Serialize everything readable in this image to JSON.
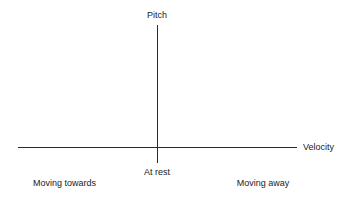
{
  "chart_data": {
    "type": "line",
    "title": "",
    "xlabel": "Velocity",
    "ylabel": "Pitch",
    "grid": false,
    "legend": "none",
    "series": [],
    "x": [],
    "annotations": [
      {
        "text": "Moving towards you",
        "position": "below-left-of-origin"
      },
      {
        "text": "At rest",
        "position": "below-origin"
      },
      {
        "text": "Moving away from you",
        "position": "below-right-of-origin"
      }
    ],
    "axes": {
      "x": {
        "label": "Velocity",
        "ticks": [],
        "origin_marker": "At rest"
      },
      "y": {
        "label": "Pitch",
        "ticks": []
      }
    }
  },
  "diagram": {
    "y_axis_label": "Pitch",
    "x_axis_label": "Velocity",
    "origin_label": "At rest",
    "left_label_line_1": "Moving towards",
    "left_label_line_2": "you",
    "right_label_line_1": "Moving away",
    "right_label_line_2": "from you"
  },
  "colors": {
    "background": "#ffffff",
    "axis": "#2b2b2b",
    "text": "#1a1a1a"
  }
}
